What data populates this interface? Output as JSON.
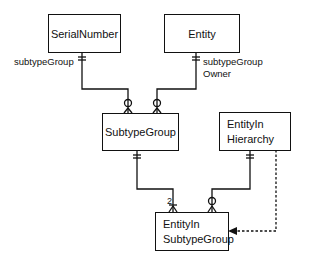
{
  "entities": {
    "serial_number": {
      "label": "SerialNumber"
    },
    "entity": {
      "label": "Entity"
    },
    "subtype_group": {
      "label": "SubtypeGroup"
    },
    "entity_in_hierarchy": {
      "line1": "EntityIn",
      "line2": "Hierarchy"
    },
    "entity_in_subtype_group": {
      "line1": "EntityIn",
      "line2": "SubtypeGroup"
    }
  },
  "relationships": {
    "serial_to_subtype": {
      "role": "subtypeGroup"
    },
    "entity_to_subtype": {
      "role_line1": "subtypeGroup",
      "role_line2": "Owner"
    },
    "subtype_to_eisg": {
      "cardinality": "2"
    },
    "eih_to_eisg": {
      "style": "solid"
    },
    "eih_dashed_to_eisg": {
      "style": "dashed-arrow"
    }
  }
}
